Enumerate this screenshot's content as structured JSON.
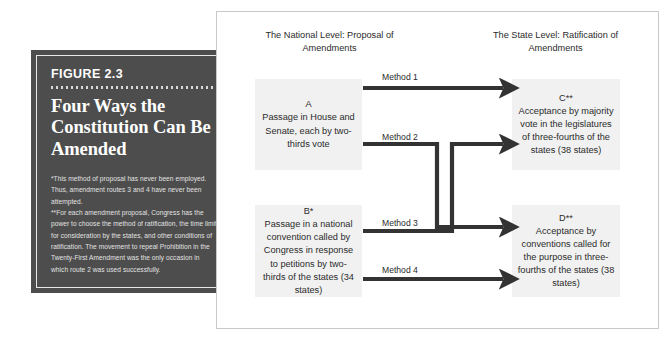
{
  "figure": {
    "number": "FIGURE 2.3",
    "title": "Four Ways the Constitution Can Be Amended",
    "notes": [
      "*This method of proposal has never been employed. Thus, amendment routes 3 and 4 have never been attempted.",
      "**For each amendment proposal, Congress has the power to choose the method of ratification, the time limit for consideration by the states, and other conditions of ratification. The movement to repeal Prohibition in the Twenty-First Amendment was the only occasion in which route 2 was used successfully."
    ],
    "background_color": "#4d4d4d",
    "text_color": "#ffffff"
  },
  "diagram": {
    "headings": {
      "national": "The National Level: Proposal of Amendments",
      "state": "The State Level: Ratification of Amendments"
    },
    "boxes": {
      "a": {
        "letter": "A",
        "text": "Passage in House and Senate, each by two-thirds vote"
      },
      "b": {
        "letter": "B*",
        "text": "Passage in a national convention called by Congress in response to petitions by two-thirds of the states (34 states)"
      },
      "c": {
        "letter": "C**",
        "text": "Acceptance by majority vote in the legislatures of three-fourths of the states (38 states)"
      },
      "d": {
        "letter": "D**",
        "text": "Acceptance by conventions called for the purpose in three-fourths of the states (38 states)"
      }
    },
    "methods": [
      {
        "label": "Method 1",
        "from": "A",
        "to": "C"
      },
      {
        "label": "Method 2",
        "from": "A",
        "to": "D"
      },
      {
        "label": "Method 3",
        "from": "B",
        "to": "C"
      },
      {
        "label": "Method 4",
        "from": "B",
        "to": "D"
      }
    ],
    "box_color": "#f1f1f1",
    "arrow_color": "#333333",
    "frame_color": "#c9c9c9"
  }
}
